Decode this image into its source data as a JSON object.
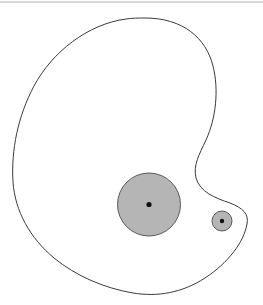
{
  "figure": {
    "width": 263,
    "height": 305,
    "background_color": "#ffffff",
    "outline_color": "#3a3a3a",
    "outline_width": 1,
    "disk_fill_color": "#b5b5b5",
    "disk_stroke_color": "#5a5a5a",
    "center_dot_color": "#111111",
    "artifact_color": "#c9c9c9"
  },
  "region": {
    "name": "outer-boundary",
    "shape": "closed kidney-bean curve",
    "filled": false,
    "path": "M 145 18 C 183 18 206 38 213 66 C 219 90 216 118 206 140 C 199 155 193 165 196 178 C 200 192 215 198 230 203 C 243 208 249 214 247 224 C 244 242 228 263 205 278 C 182 293 157 297 133 293 C 104 288 76 276 54 258 C 30 238 15 211 13 182 C 11 150 18 116 34 86 C 52 52 88 24 126 19 C 132 18 139 18 145 18 Z"
  },
  "disks": [
    {
      "id": "large-disk",
      "label": "large shaded disk",
      "cx": 149,
      "cy": 204.5,
      "r": 31.5,
      "fill": "#b5b5b5",
      "stroke": "#5a5a5a",
      "center_dot_r": 2.6
    },
    {
      "id": "small-disk",
      "label": "small shaded disk",
      "cx": 222,
      "cy": 221,
      "r": 10,
      "fill": "#b5b5b5",
      "stroke": "#5a5a5a",
      "center_dot_r": 2.2
    }
  ],
  "artifacts": [
    {
      "id": "top-scan-line",
      "description": "faint horizontal scanning artifact across top edge"
    }
  ]
}
